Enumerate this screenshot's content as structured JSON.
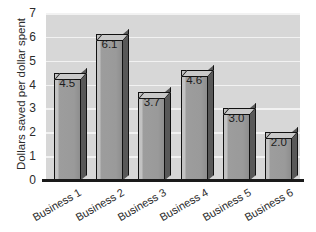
{
  "chart_data": {
    "type": "bar",
    "title": "",
    "xlabel": "",
    "ylabel": "Dollars saved per dollar spent",
    "categories": [
      "Business 1",
      "Business 2",
      "Business 3",
      "Business 4",
      "Business 5",
      "Business 6"
    ],
    "values": [
      4.5,
      6.1,
      3.7,
      4.6,
      3.0,
      2.0
    ],
    "value_labels": [
      "4.5",
      "6.1",
      "3.7",
      "4.6",
      "3.0",
      "2.0"
    ],
    "ylim": [
      0,
      7
    ],
    "ytick_labels": [
      "0",
      "1",
      "2",
      "3",
      "4",
      "5",
      "6",
      "7"
    ],
    "ytick_values": [
      0,
      1,
      2,
      3,
      4,
      5,
      6,
      7
    ],
    "grid": "horizontal",
    "legend": "none",
    "style": "3d-bar",
    "colors": {
      "plot_background": "#d7d7d7",
      "gridline": "#f2f2f2",
      "bar_front": "#9d9d9d",
      "bar_top": "#c9c9c9",
      "bar_side": "#585858",
      "bar_outline": "#111111",
      "text": "#2b2b2b",
      "axis": "#1a1a1a",
      "page_background": "#ffffff"
    }
  }
}
